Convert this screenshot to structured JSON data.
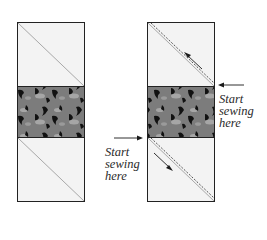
{
  "diagram": {
    "type": "quilting-instruction",
    "colors": {
      "background": "#ffffff",
      "block_fill": "#f3f3f3",
      "block_border": "#222222",
      "diagonal_line": "#a8a8a8",
      "fabric_base": "#7c7c7c",
      "fabric_light": "#a6a6a6",
      "fabric_dark": "#111111",
      "arrow": "#1a1a1a"
    },
    "panels": [
      {
        "id": "left",
        "description": "Unit with marked diagonal lines",
        "segments": [
          "top-light-square",
          "center-print-band",
          "bottom-light-square"
        ],
        "diagonals": [
          "top-square",
          "bottom-square"
        ]
      },
      {
        "id": "right",
        "description": "Unit with stitching lines alongside diagonals",
        "segments": [
          "top-light-square",
          "center-print-band",
          "bottom-light-square"
        ],
        "stitch_lines": [
          "top-square",
          "bottom-square"
        ],
        "direction_arrows": [
          "up-left in top square",
          "down-right in bottom square"
        ]
      }
    ],
    "labels": {
      "right_label": {
        "line1": "Start",
        "line2": "sewing",
        "line3": "here"
      },
      "left_label": {
        "line1": "Start",
        "line2": "sewing",
        "line3": "here"
      }
    }
  }
}
